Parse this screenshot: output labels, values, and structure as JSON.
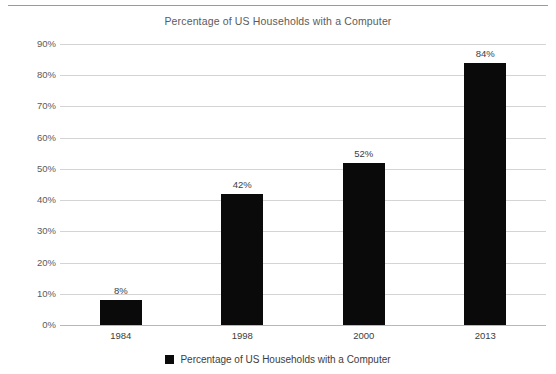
{
  "chart_data": {
    "type": "bar",
    "title": "Percentage of US Households with a Computer",
    "xlabel": "",
    "ylabel": "",
    "categories": [
      "1984",
      "1998",
      "2000",
      "2013"
    ],
    "values": [
      8,
      42,
      52,
      84
    ],
    "value_labels": [
      "8%",
      "42%",
      "52%",
      "84%"
    ],
    "series": [
      {
        "name": "Percentage of US Households with a Computer",
        "values": [
          8,
          42,
          52,
          84
        ],
        "color": "#0a0a0a"
      }
    ],
    "ylim": [
      0,
      90
    ],
    "ytick_values": [
      0,
      10,
      20,
      30,
      40,
      50,
      60,
      70,
      80,
      90
    ],
    "ytick_labels": [
      "0%",
      "10%",
      "20%",
      "30%",
      "40%",
      "50%",
      "60%",
      "70%",
      "80%",
      "90%"
    ],
    "grid": true,
    "legend_position": "bottom",
    "legend_entries": [
      {
        "label": "Percentage of US Households with a Computer",
        "marker": "square",
        "color": "#0a0a0a"
      }
    ],
    "colors": {
      "bar": "#0a0a0a",
      "gridline": "#d4d4d4",
      "baseline": "#b8b8b8",
      "title_text": "#5b5b5b",
      "tick_text": "#5b5b5b",
      "label_text": "#3d3d3d",
      "background": "#ffffff",
      "top_rule": "#9a9a9a"
    }
  }
}
